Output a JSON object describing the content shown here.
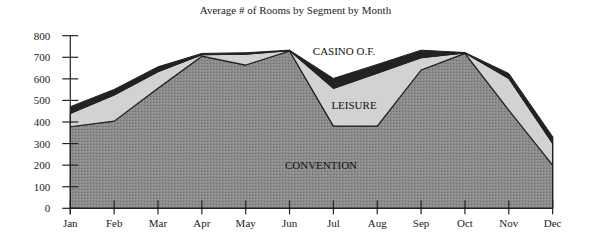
{
  "chart_data": {
    "type": "area",
    "stacked": true,
    "title": "Average # of Rooms by Segment by Month",
    "xlabel": "",
    "ylabel": "",
    "categories": [
      "Jan",
      "Feb",
      "Mar",
      "Apr",
      "May",
      "Jun",
      "Jul",
      "Aug",
      "Sep",
      "Oct",
      "Nov",
      "Dec"
    ],
    "ylim": [
      0,
      800
    ],
    "yticks": [
      0,
      100,
      200,
      300,
      400,
      500,
      600,
      700,
      800
    ],
    "grid": false,
    "legend": "inline labels",
    "series": [
      {
        "name": "CONVENTION",
        "color": "#8c8c8c",
        "values": [
          378,
          404,
          556,
          705,
          664,
          729,
          381,
          381,
          641,
          718,
          455,
          200
        ]
      },
      {
        "name": "LEISURE",
        "color": "#d2d2d2",
        "values": [
          62,
          121,
          77,
          7,
          50,
          2,
          175,
          245,
          57,
          2,
          147,
          101
        ]
      },
      {
        "name": "CASINO O.F.",
        "color": "#222222",
        "values": [
          31,
          26,
          23,
          6,
          7,
          2,
          46,
          41,
          35,
          2,
          23,
          31
        ]
      }
    ],
    "annotations": [
      {
        "text": "CASINO O.F.",
        "x": "Jul",
        "y": 710
      },
      {
        "text": "LEISURE",
        "x": "Jul",
        "y": 480
      },
      {
        "text": "CONVENTION",
        "x": "Jul",
        "y": 200
      }
    ]
  }
}
